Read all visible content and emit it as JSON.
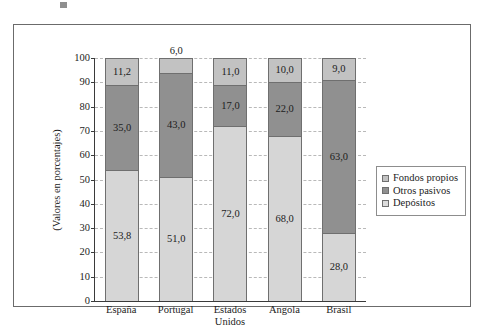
{
  "figure": {
    "y_axis_title": "(Valores en porcentajes)"
  },
  "chart_data": {
    "type": "bar",
    "subtype": "stacked-bar-100",
    "title": "",
    "xlabel": "",
    "ylabel": "(Valores en porcentajes)",
    "ylim": [
      0,
      100
    ],
    "ytick_step": 10,
    "ytick_labels": [
      "0",
      "10",
      "20",
      "30",
      "40",
      "50",
      "60",
      "70",
      "80",
      "90",
      "100"
    ],
    "grid": true,
    "grid_style": "dashed-horizontal",
    "legend_position": "right",
    "categories": [
      "España",
      "Portugal",
      "Estados Unidos",
      "Angola",
      "Brasil"
    ],
    "category_lines": [
      [
        "España"
      ],
      [
        "Portugal"
      ],
      [
        "Estados",
        "Unidos"
      ],
      [
        "Angola"
      ],
      [
        "Brasil"
      ]
    ],
    "series": [
      {
        "name": "Depósitos",
        "color": "#d6d6d6",
        "values": [
          53.8,
          51.0,
          72.0,
          68.0,
          28.0
        ],
        "labels": [
          "53,8",
          "51,0",
          "72,0",
          "68,0",
          "28,0"
        ]
      },
      {
        "name": "Otros pasivos",
        "color": "#909090",
        "values": [
          35.0,
          43.0,
          17.0,
          22.0,
          63.0
        ],
        "labels": [
          "35,0",
          "43,0",
          "17,0",
          "22,0",
          "63,0"
        ]
      },
      {
        "name": "Fondos propios",
        "color": "#c2c2c2",
        "values": [
          11.2,
          6.0,
          11.0,
          10.0,
          9.0
        ],
        "labels": [
          "11,2",
          "6,0",
          "11,0",
          "10,0",
          "9,0"
        ]
      }
    ],
    "legend_entries": [
      {
        "label": "Fondos propios",
        "color": "#c2c2c2"
      },
      {
        "label": "Otros pasivos",
        "color": "#909090"
      },
      {
        "label": "Depósitos",
        "color": "#dcdcdc"
      }
    ]
  }
}
